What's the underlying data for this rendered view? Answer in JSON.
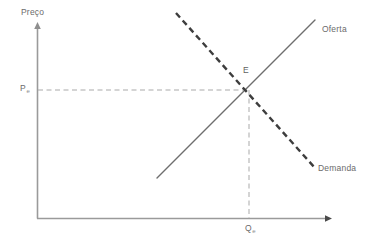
{
  "figure": {
    "background_color": "#ffffff"
  },
  "axes": {
    "y_label": "Preço",
    "x_label": "",
    "axis_color": "#9a9a9a",
    "origin": {
      "x": 37,
      "y": 218
    },
    "y_axis_top": {
      "x": 37,
      "y": 24
    },
    "x_axis_right": {
      "x": 331,
      "y": 218
    }
  },
  "labels": {
    "price_equilibrium": "P",
    "price_equilibrium_sub": "e",
    "quantity_equilibrium": "Q",
    "quantity_equilibrium_sub": "e",
    "equilibrium_point": "E",
    "supply_curve": "Oferta",
    "demand_curve": "Demanda",
    "text_color": "#6b6b6b"
  },
  "chart_data": {
    "type": "line",
    "title": "",
    "xlabel": "",
    "ylabel": "Preço",
    "grid": false,
    "legend": "inline-curve-labels",
    "axis_arrows": true,
    "series": [
      {
        "name": "Oferta",
        "style": "solid",
        "color": "#6e6e6e",
        "width": 1.4,
        "points": [
          {
            "x": 157,
            "y": 178
          },
          {
            "x": 315,
            "y": 20
          }
        ],
        "slope": "positive",
        "label": "Oferta",
        "label_position": {
          "x": 322,
          "y": 25
        }
      },
      {
        "name": "Demanda",
        "style": "dashed",
        "color": "#3d3d3d",
        "width": 2.4,
        "dash": "6 4",
        "points": [
          {
            "x": 176,
            "y": 13
          },
          {
            "x": 315,
            "y": 168
          }
        ],
        "slope": "negative",
        "label": "Demanda",
        "label_position": {
          "x": 318,
          "y": 164
        }
      }
    ],
    "equilibrium": {
      "label": "E",
      "point": {
        "x": 248,
        "y": 90
      },
      "price_value_label": "Pe",
      "quantity_value_label": "Qe",
      "guide_color": "#a9a9a9",
      "guide_style": "dashed",
      "horizontal_guide": {
        "x1": 38,
        "y1": 90,
        "x2": 248,
        "y2": 90
      },
      "vertical_guide": {
        "x1": 249,
        "y1": 90,
        "x2": 249,
        "y2": 218
      }
    },
    "annotations": [
      {
        "text": "Preço",
        "x": 21,
        "y": 8,
        "role": "y-axis-title"
      },
      {
        "text": "Pe",
        "x": 20,
        "y": 84,
        "role": "equilibrium-price-tick"
      },
      {
        "text": "Qe",
        "x": 245,
        "y": 224,
        "role": "equilibrium-quantity-tick"
      },
      {
        "text": "E",
        "x": 243,
        "y": 66,
        "role": "equilibrium-marker-label"
      },
      {
        "text": "Oferta",
        "x": 322,
        "y": 25,
        "role": "supply-curve-label"
      },
      {
        "text": "Demanda",
        "x": 318,
        "y": 164,
        "role": "demand-curve-label"
      }
    ]
  }
}
